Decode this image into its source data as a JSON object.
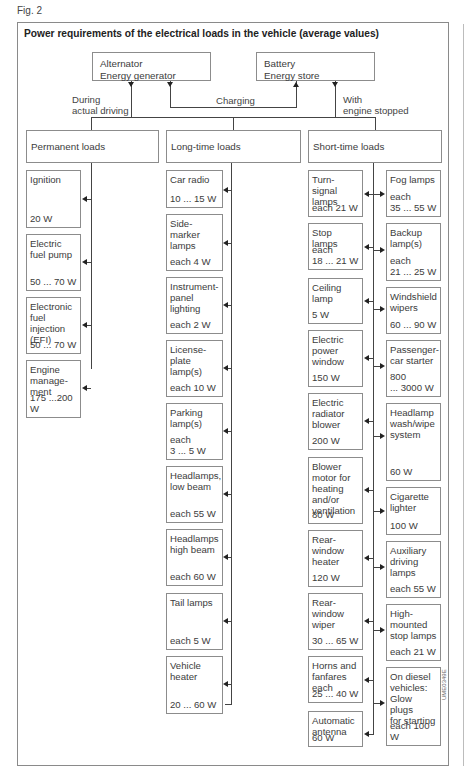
{
  "figure": {
    "label": "Fig. 2",
    "title": "Power requirements of the electrical loads in the vehicle (average values)",
    "code": "UME0349E"
  },
  "sources": {
    "alternator": "Alternator\nEnergy generator",
    "battery": "Battery\nEnergy store"
  },
  "flows": {
    "driving": "During\nactual driving",
    "charging": "Charging",
    "stopped": "With\nengine stopped"
  },
  "categories": {
    "permanent": "Permanent loads",
    "long_time": "Long-time loads",
    "short_time": "Short-time loads"
  },
  "permanent_loads": [
    {
      "name": "Ignition",
      "value": "20 W"
    },
    {
      "name": "Electric\nfuel pump",
      "value": "50 ... 70 W"
    },
    {
      "name": "Electronic\nfuel injection\n(EFI)",
      "value": "50 ... 70 W"
    },
    {
      "name": "Engine\nmanage-\nment",
      "value": "175 ...200 W"
    }
  ],
  "long_time_loads": [
    {
      "name": "Car radio",
      "value": "10 ... 15 W"
    },
    {
      "name": "Side-marker\nlamps",
      "value": "each 4 W"
    },
    {
      "name": "Instrument-\npanel\nlighting",
      "value": "each 2 W"
    },
    {
      "name": "License-\nplate\nlamp(s)",
      "value": "each 10 W"
    },
    {
      "name": "Parking\nlamp(s)",
      "value": "each\n3 ... 5 W"
    },
    {
      "name": "Headlamps,\nlow beam",
      "value": "each 55 W"
    },
    {
      "name": "Headlamps\nhigh beam",
      "value": "each 60 W"
    },
    {
      "name": "Tail lamps",
      "value": "each 5 W"
    },
    {
      "name": "Vehicle\nheater",
      "value": "20 ... 60 W"
    }
  ],
  "short_time_loads_left": [
    {
      "name": "Turn-signal\nlamps",
      "value": "each 21 W"
    },
    {
      "name": "Stop lamps",
      "value": "each\n18 ... 21 W"
    },
    {
      "name": "Ceiling lamp",
      "value": "5 W"
    },
    {
      "name": "Electric\npower\nwindow",
      "value": "150 W"
    },
    {
      "name": "Electric\nradiator\nblower",
      "value": "200 W"
    },
    {
      "name": "Blower\nmotor for\nheating\nand/or\nventilation",
      "value": "80 W"
    },
    {
      "name": "Rear-\nwindow\nheater",
      "value": "120 W"
    },
    {
      "name": "Rear-\nwindow\nwiper",
      "value": "30 ... 65 W"
    },
    {
      "name": "Horns and\nfanfares\neach",
      "value": "25 ... 40 W"
    },
    {
      "name": "Automatic\nantenna",
      "value": "60 W"
    }
  ],
  "short_time_loads_right": [
    {
      "name": "Fog lamps",
      "value": "each\n35 ... 55 W"
    },
    {
      "name": "Backup\nlamp(s)",
      "value": "each\n21 ... 25 W"
    },
    {
      "name": "Windshield\nwipers",
      "value": "60 ... 90 W"
    },
    {
      "name": "Passenger-\ncar starter",
      "value": "800\n... 3000 W"
    },
    {
      "name": "Headlamp\nwash/wipe\nsystem",
      "value": "60 W"
    },
    {
      "name": "Cigarette\nlighter",
      "value": "100 W"
    },
    {
      "name": "Auxiliary\ndriving\nlamps",
      "value": "each 55 W"
    },
    {
      "name": "High-\nmounted\nstop lamps",
      "value": "each 21 W"
    },
    {
      "name": "On diesel\nvehicles:\nGlow plugs\nfor starting",
      "value": "each 100 W"
    }
  ],
  "colors": {
    "line": "#444444",
    "border": "#8c8c8c",
    "text": "#3c3c3c"
  }
}
